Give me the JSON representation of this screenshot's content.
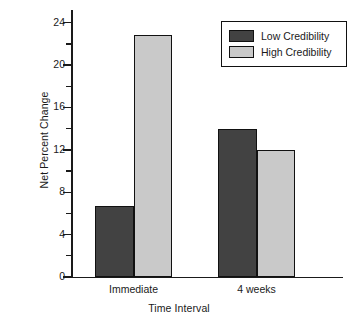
{
  "chart_data": {
    "type": "bar",
    "title": "",
    "xlabel": "Time Interval",
    "ylabel": "Net Percent Change",
    "categories": [
      "Immediate",
      "4 weeks"
    ],
    "series": [
      {
        "name": "Low Credibility",
        "color": "#424242",
        "values": [
          6.7,
          14.0
        ]
      },
      {
        "name": "High Credibility",
        "color": "#c9c9c9",
        "values": [
          22.8,
          12.0
        ]
      }
    ],
    "ylim": [
      0,
      25.2
    ],
    "ytick_labels": [
      "0",
      "4",
      "8",
      "12",
      "16",
      "20",
      "24"
    ],
    "ytick_values": [
      0,
      4,
      8,
      12,
      16,
      20,
      24
    ],
    "yminor_values": [
      2,
      6,
      10,
      14,
      18,
      22
    ],
    "grid": false,
    "legend_position": "top-right"
  },
  "legend": {
    "items": [
      {
        "label": "Low Credibility",
        "swatch": "low"
      },
      {
        "label": "High Credibility",
        "swatch": "high"
      }
    ]
  },
  "colors": {
    "low_credibility": "#424242",
    "high_credibility": "#c9c9c9",
    "axis": "#1a1a1a",
    "background": "#ffffff"
  }
}
